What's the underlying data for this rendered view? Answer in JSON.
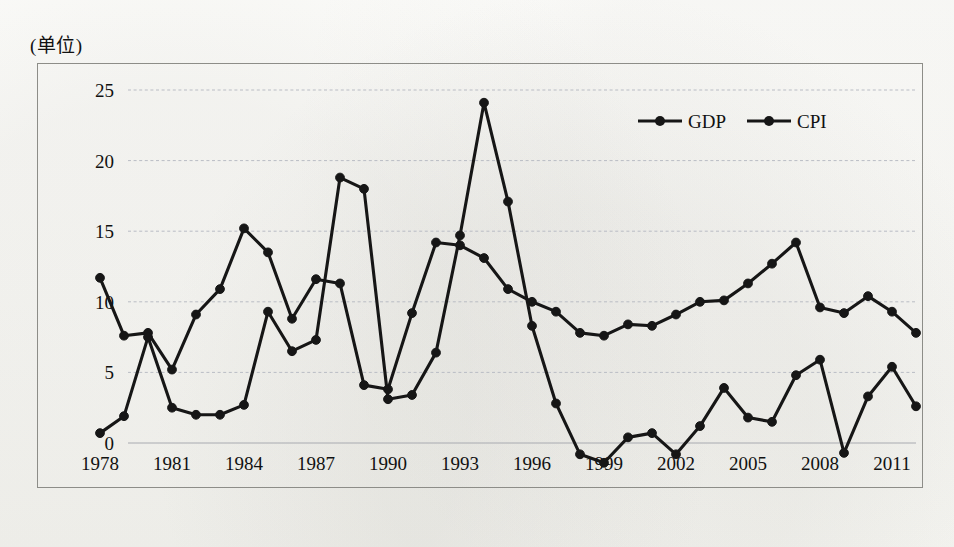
{
  "unit_label": "(单位)",
  "x_axis_caption": "(年份)",
  "legend": [
    {
      "key": "gdp",
      "label": "GDP"
    },
    {
      "key": "cpi",
      "label": "CPI"
    }
  ],
  "chart_data": {
    "type": "line",
    "title": "",
    "subtitle": "",
    "xlabel": "(年份)",
    "ylabel": "(单位)",
    "grid": true,
    "legend_position": "top-right",
    "xlim": [
      1978,
      2012
    ],
    "ylim": [
      -5,
      25
    ],
    "y_ticks": [
      -5,
      0,
      5,
      10,
      15,
      20,
      25
    ],
    "x_ticks": [
      1978,
      1981,
      1984,
      1987,
      1990,
      1993,
      1996,
      1999,
      2002,
      2005,
      2008,
      2011
    ],
    "x": [
      1978,
      1979,
      1980,
      1981,
      1982,
      1983,
      1984,
      1985,
      1986,
      1987,
      1988,
      1989,
      1990,
      1991,
      1992,
      1993,
      1994,
      1995,
      1996,
      1997,
      1998,
      1999,
      2000,
      2001,
      2002,
      2003,
      2004,
      2005,
      2006,
      2007,
      2008,
      2009,
      2010,
      2011,
      2012
    ],
    "series": [
      {
        "name": "GDP",
        "color": "#161616",
        "values": [
          11.7,
          7.6,
          7.8,
          5.2,
          9.1,
          10.9,
          15.2,
          13.5,
          8.8,
          11.6,
          11.3,
          4.1,
          3.8,
          9.2,
          14.2,
          14.0,
          13.1,
          10.9,
          10.0,
          9.3,
          7.8,
          7.6,
          8.4,
          8.3,
          9.1,
          10.0,
          10.1,
          11.3,
          12.7,
          14.2,
          9.6,
          9.2,
          10.4,
          9.3,
          7.8
        ]
      },
      {
        "name": "CPI",
        "color": "#161616",
        "values": [
          0.7,
          1.9,
          7.5,
          2.5,
          2.0,
          2.0,
          2.7,
          9.3,
          6.5,
          7.3,
          18.8,
          18.0,
          3.1,
          3.4,
          6.4,
          14.7,
          24.1,
          17.1,
          8.3,
          2.8,
          -0.8,
          -1.4,
          0.4,
          0.7,
          -0.8,
          1.2,
          3.9,
          1.8,
          1.5,
          4.8,
          5.9,
          -0.7,
          3.3,
          5.4,
          2.6
        ]
      }
    ],
    "annotations": {
      "cpi_peak_year": 1994,
      "cpi_peak_value": 24.1,
      "gdp_peak_value": 15.2
    }
  }
}
